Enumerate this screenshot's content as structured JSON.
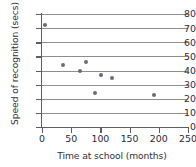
{
  "chart_data": {
    "type": "scatter",
    "title": "",
    "xlabel": "Time at school (months)",
    "ylabel": "Speed of recognition (secs)",
    "xlim": [
      0,
      250
    ],
    "ylim": [
      0,
      80
    ],
    "xticks": [
      0,
      50,
      100,
      150,
      200,
      250
    ],
    "yticks": [
      0,
      10,
      20,
      30,
      40,
      50,
      60,
      70,
      80
    ],
    "grid": "horizontal",
    "legend": "none",
    "marker_color": "#6b6b74",
    "grid_color": "#8d8d93",
    "axis_color": "#5d5d66",
    "text_color": "#2f2f3a",
    "points": [
      {
        "x": 5,
        "y": 72
      },
      {
        "x": 36,
        "y": 44
      },
      {
        "x": 65,
        "y": 40
      },
      {
        "x": 76,
        "y": 46
      },
      {
        "x": 90,
        "y": 24
      },
      {
        "x": 101,
        "y": 37
      },
      {
        "x": 120,
        "y": 35
      },
      {
        "x": 192,
        "y": 23
      }
    ]
  }
}
